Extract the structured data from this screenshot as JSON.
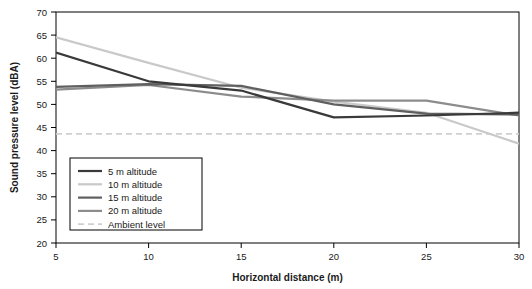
{
  "chart_data": {
    "type": "line",
    "title": "",
    "xlabel": "Horizontal distance (m)",
    "ylabel": "Sound pressure level (dBA)",
    "xlim": [
      5,
      30
    ],
    "ylim": [
      20,
      70
    ],
    "xticks": [
      "5",
      "10",
      "15",
      "20",
      "25",
      "30"
    ],
    "yticks": [
      "20",
      "25",
      "30",
      "35",
      "40",
      "45",
      "50",
      "55",
      "60",
      "65",
      "70"
    ],
    "grid": false,
    "legend_position": "lower-left-inside",
    "x": [
      5,
      10,
      15,
      20,
      25,
      30
    ],
    "series": [
      {
        "name": "5 m altitude",
        "values": [
          61.2,
          55.0,
          53.0,
          47.2,
          47.6,
          48.2
        ],
        "color": "#3a3a3a",
        "width": 2.2,
        "dash": "none"
      },
      {
        "name": "10 m altitude",
        "values": [
          64.5,
          59.0,
          53.6,
          50.6,
          48.2,
          41.5
        ],
        "color": "#c9c9c9",
        "width": 2.2,
        "dash": "none"
      },
      {
        "name": "15 m altitude",
        "values": [
          53.8,
          54.4,
          54.0,
          50.0,
          48.0,
          47.8
        ],
        "color": "#5f5f5f",
        "width": 2.2,
        "dash": "none"
      },
      {
        "name": "20 m altitude",
        "values": [
          53.2,
          54.2,
          51.7,
          50.8,
          50.8,
          47.6
        ],
        "color": "#8c8c8c",
        "width": 2.2,
        "dash": "none"
      },
      {
        "name": "Ambient level",
        "values": [
          43.6,
          43.6,
          43.6,
          43.6,
          43.6,
          43.6
        ],
        "color": "#cfcfcf",
        "width": 1.8,
        "dash": "6,4"
      }
    ],
    "legend": [
      {
        "label": "5 m altitude",
        "color": "#3a3a3a",
        "dash": "none"
      },
      {
        "label": "10 m altitude",
        "color": "#c9c9c9",
        "dash": "none"
      },
      {
        "label": "15 m altitude",
        "color": "#5f5f5f",
        "dash": "none"
      },
      {
        "label": "20 m altitude",
        "color": "#8c8c8c",
        "dash": "none"
      },
      {
        "label": "Ambient level",
        "color": "#cfcfcf",
        "dash": "6,4"
      }
    ]
  }
}
